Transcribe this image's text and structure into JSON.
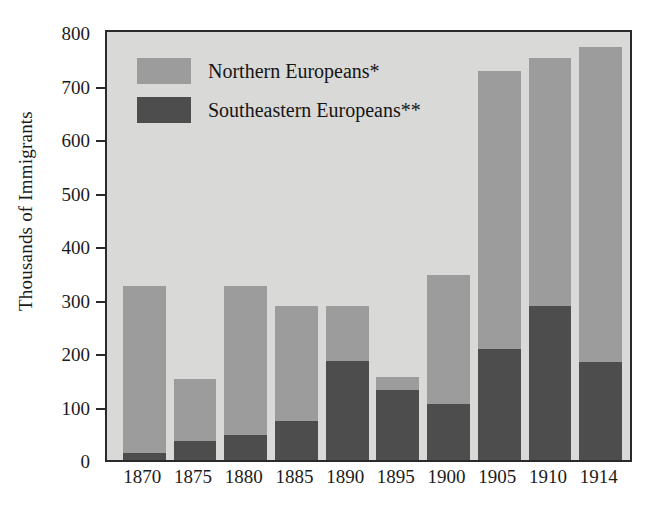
{
  "chart_data": {
    "type": "bar",
    "subtype": "stacked-vertical",
    "title": "",
    "xlabel": "",
    "ylabel": "Thousands of Immigrants",
    "ylim": [
      0,
      800
    ],
    "yticks": [
      0,
      100,
      200,
      300,
      400,
      500,
      600,
      700,
      800
    ],
    "ytick_labels": [
      "0",
      "100",
      "200",
      "300",
      "400",
      "500",
      "600",
      "700",
      "800"
    ],
    "grid": false,
    "legend_position": "upper-left-inside",
    "categories": [
      "1870",
      "1875",
      "1880",
      "1885",
      "1890",
      "1895",
      "1900",
      "1905",
      "1910",
      "1914"
    ],
    "series": [
      {
        "name": "Southeastern Europeans**",
        "color": "#4d4d4d",
        "values": [
          13,
          35,
          46,
          72,
          186,
          130,
          105,
          207,
          288,
          184
        ]
      },
      {
        "name": "Northern Europeans*",
        "color": "#9c9c9c",
        "values": [
          312,
          116,
          280,
          215,
          101,
          25,
          240,
          521,
          464,
          588
        ]
      }
    ],
    "totals": [
      325,
      151,
      326,
      287,
      287,
      155,
      345,
      728,
      752,
      772
    ],
    "annotations": []
  },
  "legend": {
    "items": [
      {
        "label": "Northern Europeans*",
        "color": "#9c9c9c"
      },
      {
        "label": "Southeastern Europeans**",
        "color": "#4d4d4d"
      }
    ]
  },
  "colors": {
    "plot_background": "#d9d9d7",
    "page_background": "#ffffff",
    "axis": "#2a2a2a",
    "text": "#1b1b1b",
    "northern": "#9c9c9c",
    "southeastern": "#4d4d4d"
  }
}
